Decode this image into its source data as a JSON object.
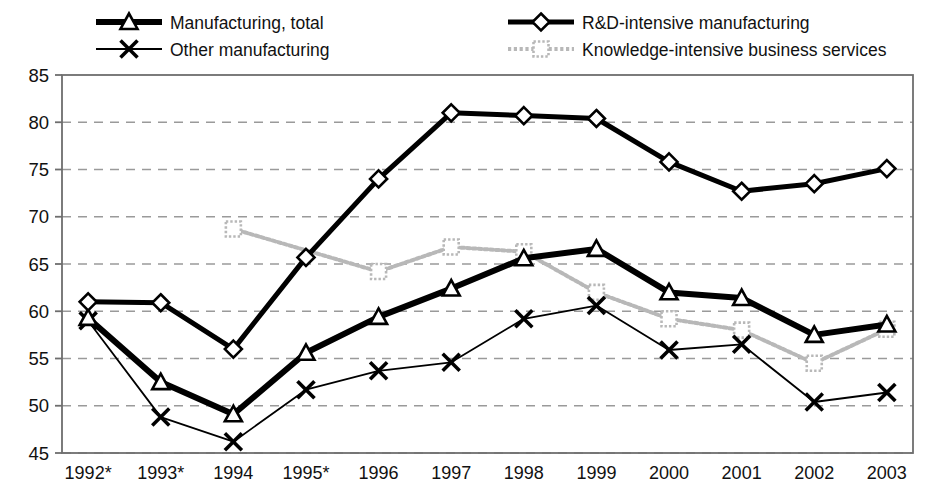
{
  "chart_data": {
    "type": "line",
    "title": "",
    "subtitle": "",
    "xlabel": "",
    "ylabel": "",
    "ylim": [
      45,
      85
    ],
    "ytick_step": 5,
    "yticks": [
      45,
      50,
      55,
      60,
      65,
      70,
      75,
      80,
      85
    ],
    "grid": "horizontal-dashed",
    "legend_position": "top",
    "categories": [
      "1992*",
      "1993*",
      "1994",
      "1995*",
      "1996",
      "1997",
      "1998",
      "1999",
      "2000",
      "2001",
      "2002",
      "2003"
    ],
    "series": [
      {
        "name": "Manufacturing, total",
        "marker": "triangle",
        "color": "#000000",
        "line_width": 6,
        "style": "solid-thick",
        "values": [
          59.3,
          52.5,
          49.1,
          55.6,
          59.4,
          62.4,
          65.6,
          66.6,
          62.0,
          61.4,
          57.5,
          58.6
        ]
      },
      {
        "name": "R&D-intensive manufacturing",
        "marker": "diamond",
        "color": "#000000",
        "line_width": 5,
        "style": "solid-thick",
        "values": [
          61.0,
          60.9,
          56.0,
          65.7,
          74.0,
          81.0,
          80.7,
          80.4,
          75.8,
          72.7,
          73.5,
          75.1
        ]
      },
      {
        "name": "Other manufacturing",
        "marker": "cross",
        "color": "#000000",
        "line_width": 1.8,
        "style": "solid-thin",
        "values": [
          59.0,
          48.8,
          46.2,
          51.7,
          53.7,
          54.6,
          59.2,
          60.6,
          55.9,
          56.5,
          50.4,
          51.4
        ]
      },
      {
        "name": "Knowledge-intensive business services",
        "marker": "square",
        "color": "#b8b8b8",
        "line_width": 4,
        "style": "dotted-gray",
        "values": [
          null,
          null,
          68.7,
          null,
          64.2,
          66.8,
          66.3,
          62.0,
          59.2,
          58.0,
          54.5,
          58.1
        ]
      }
    ]
  },
  "legend": {
    "items": [
      {
        "label": "Manufacturing, total",
        "marker": "triangle-icon",
        "column": 1
      },
      {
        "label": "Other manufacturing",
        "marker": "cross-icon",
        "column": 1
      },
      {
        "label": "R&D-intensive manufacturing",
        "marker": "diamond-icon",
        "column": 2
      },
      {
        "label": "Knowledge-intensive business services",
        "marker": "square-icon",
        "column": 2
      }
    ]
  },
  "colors": {
    "background": "#ffffff",
    "axis": "#6e6e6e",
    "grid": "#9a9a9a",
    "primary": "#000000",
    "knowledge_series": "#b8b8b8"
  }
}
